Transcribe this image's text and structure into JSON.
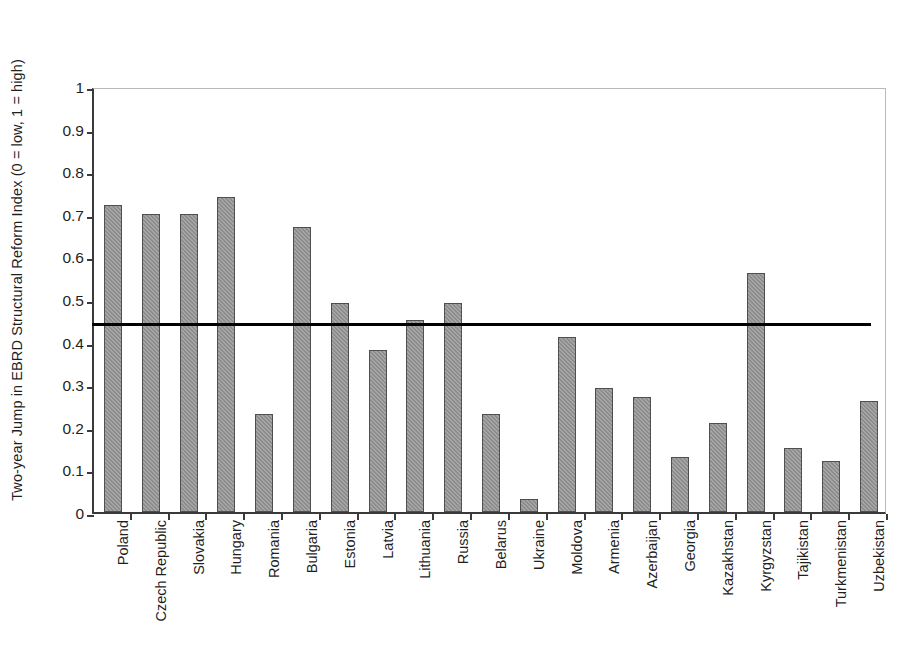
{
  "chart_data": {
    "type": "bar",
    "title": "",
    "xlabel": "",
    "ylabel": "Two-year Jump in EBRD Structural Reform Index (0 = low, 1 = high)",
    "ylim": [
      0,
      1
    ],
    "ytick_labels": [
      "1",
      "0.9",
      "0.8",
      "0.7",
      "0.6",
      "0.5",
      "0.4",
      "0.3",
      "0.2",
      "0.1",
      "0"
    ],
    "ytick_values": [
      1,
      0.9,
      0.8,
      0.7,
      0.6,
      0.5,
      0.4,
      0.3,
      0.2,
      0.1,
      0
    ],
    "grid": false,
    "legend": "none",
    "bar_color": "#8c8c8c",
    "bar_border_color": "#4f4f4f",
    "reference_line": {
      "label": "",
      "value": 0.45,
      "color": "#000000"
    },
    "categories": [
      "Poland",
      "Czech Republic",
      "Slovakia",
      "Hungary",
      "Romania",
      "Bulgaria",
      "Estonia",
      "Latvia",
      "Lithuania",
      "Russia",
      "Belarus",
      "Ukraine",
      "Moldova",
      "Armenia",
      "Azerbaijan",
      "Georgia",
      "Kazakhstan",
      "Kyrgyzstan",
      "Tajikistan",
      "Turkmenistan",
      "Uzbekistan"
    ],
    "values": [
      0.72,
      0.7,
      0.7,
      0.74,
      0.23,
      0.67,
      0.49,
      0.38,
      0.45,
      0.49,
      0.23,
      0.03,
      0.41,
      0.29,
      0.27,
      0.13,
      0.21,
      0.56,
      0.15,
      0.12,
      0.26
    ]
  }
}
